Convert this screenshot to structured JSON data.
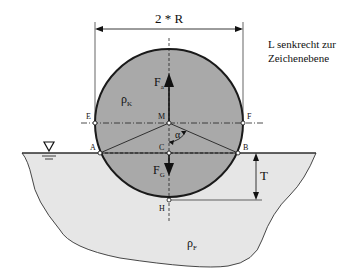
{
  "diagram": {
    "dimension_label": "2 * R",
    "note_line1": "L senkrecht zur",
    "note_line2": "Zeichenebene",
    "points": {
      "E": "E",
      "F": "F",
      "M": "M",
      "A": "A",
      "B": "B",
      "C": "C",
      "H": "H"
    },
    "forces": {
      "buoyancy_main": "F",
      "buoyancy_sub": "a",
      "weight_main": "F",
      "weight_sub": "G"
    },
    "densities": {
      "body_main": "ρ",
      "body_sub": "K",
      "fluid_main": "ρ",
      "fluid_sub": "F"
    },
    "angle_label": "α",
    "depth_label": "T",
    "colors": {
      "body_fill": "#a9a9a9",
      "fluid_fill": "#e6e6e6",
      "outline": "#1a1a1a"
    }
  }
}
